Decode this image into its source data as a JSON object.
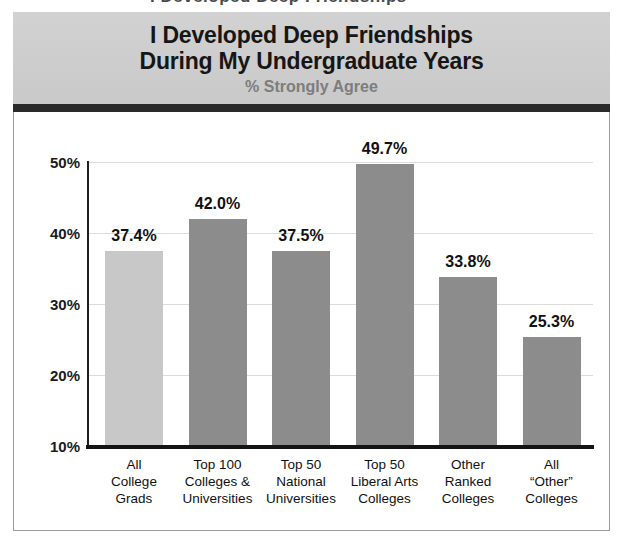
{
  "page": {
    "top_fragment": "I Developed Deep Friendships"
  },
  "header": {
    "title_line1": "I Developed Deep Friendships",
    "title_line2": "During My Undergraduate Years",
    "subtitle": "% Strongly Agree",
    "band_color": "#cfcfcf",
    "rule_color": "#2a2a2a",
    "title_color": "#161616",
    "subtitle_color": "#7d7d7d"
  },
  "chart_data": {
    "type": "bar",
    "title": "I Developed Deep Friendships During My Undergraduate Years",
    "subtitle": "% Strongly Agree",
    "xlabel": "",
    "ylabel": "",
    "ylim": [
      10,
      50
    ],
    "yticks": [
      "10%",
      "20%",
      "30%",
      "40%",
      "50%"
    ],
    "ytick_values": [
      10,
      20,
      30,
      40,
      50
    ],
    "grid": true,
    "legend": "none",
    "categories": [
      [
        "All",
        "College",
        "Grads"
      ],
      [
        "Top 100",
        "Colleges &",
        "Universities"
      ],
      [
        "Top 50",
        "National",
        "Universities"
      ],
      [
        "Top 50",
        "Liberal Arts",
        "Colleges"
      ],
      [
        "Other",
        "Ranked",
        "Colleges"
      ],
      [
        "All",
        "“Other”",
        "Colleges"
      ]
    ],
    "values": [
      37.4,
      42.0,
      37.5,
      49.7,
      33.8,
      25.3
    ],
    "value_labels": [
      "37.4%",
      "42.0%",
      "37.5%",
      "49.7%",
      "33.8%",
      "25.3%"
    ],
    "bar_colors": [
      "#c8c8c8",
      "#8c8c8c",
      "#8c8c8c",
      "#8c8c8c",
      "#8c8c8c",
      "#8c8c8c"
    ],
    "highlight_color": "#c8c8c8",
    "series_color": "#8c8c8c",
    "gridline_color": "#dcdcdc",
    "axis_color": "#141414"
  }
}
